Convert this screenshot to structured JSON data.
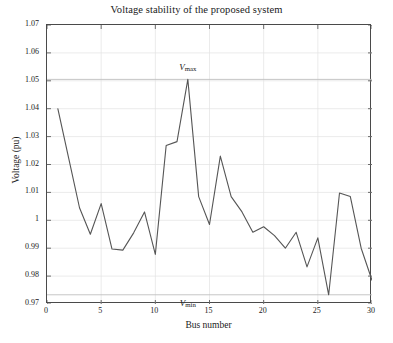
{
  "chart_data": {
    "type": "line",
    "title": "Voltage stability of the proposed system",
    "xlabel": "Bus number",
    "ylabel": "Voltage (pu)",
    "xlim": [
      0,
      30
    ],
    "ylim": [
      0.97,
      1.07
    ],
    "grid": true,
    "legend_position": "none",
    "x_ticks": [
      "0",
      "5",
      "10",
      "15",
      "20",
      "25",
      "30"
    ],
    "x_tick_values": [
      0,
      5,
      10,
      15,
      20,
      25,
      30
    ],
    "y_ticks": [
      "0.97",
      "0.98",
      "0.99",
      "1",
      "1.01",
      "1.02",
      "1.03",
      "1.04",
      "1.05",
      "1.06",
      "1.07"
    ],
    "y_tick_values": [
      0.97,
      0.98,
      0.99,
      1.0,
      1.01,
      1.02,
      1.03,
      1.04,
      1.05,
      1.06,
      1.07
    ],
    "series": [
      {
        "name": "Voltage (pu)",
        "color": "#555555",
        "x": [
          1,
          2,
          3,
          4,
          5,
          6,
          7,
          8,
          9,
          10,
          11,
          12,
          13,
          14,
          15,
          16,
          17,
          18,
          19,
          20,
          21,
          22,
          23,
          24,
          25,
          26,
          27,
          28,
          29,
          30
        ],
        "values": [
          1.04,
          1.0223,
          1.0045,
          0.995,
          1.006,
          0.9897,
          0.9893,
          0.9955,
          1.003,
          0.9878,
          1.0268,
          1.0282,
          1.0505,
          1.0085,
          0.9985,
          1.023,
          1.0085,
          1.003,
          0.9957,
          0.9977,
          0.9945,
          0.99,
          0.9957,
          0.9833,
          0.9937,
          0.9733,
          1.0098,
          1.0085,
          0.99,
          0.9785
        ]
      }
    ],
    "reference_lines": [
      {
        "name": "v-max-line",
        "label": "Vmax",
        "label_v": "V",
        "label_sub": "max",
        "value": 1.0505,
        "color": "#bfbfbf",
        "label_x": 13
      },
      {
        "name": "v-min-line",
        "label": "Vmin",
        "label_v": "V",
        "label_sub": "min",
        "value": 0.9733,
        "color": "#bfbfbf",
        "label_x": 13
      }
    ]
  },
  "colors": {
    "axis": "#4a4a4a",
    "grid": "#e2e2e2",
    "line": "#555555",
    "reference": "#bfbfbf",
    "background": "#ffffff",
    "text": "#1a1a1a"
  }
}
